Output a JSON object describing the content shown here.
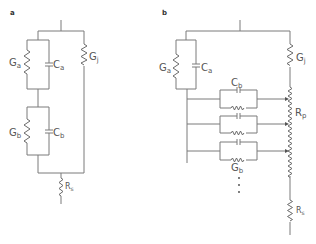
{
  "panels": [
    {
      "id": "a",
      "label": "a",
      "components": {
        "Ga": {
          "symbol": "G",
          "sub": "a",
          "type": "resistor"
        },
        "Ca": {
          "symbol": "C",
          "sub": "a",
          "type": "capacitor"
        },
        "Gb": {
          "symbol": "G",
          "sub": "b",
          "type": "resistor"
        },
        "Cb": {
          "symbol": "C",
          "sub": "b",
          "type": "capacitor"
        },
        "Gj": {
          "symbol": "G",
          "sub": "j",
          "type": "resistor"
        },
        "Rs": {
          "symbol": "R",
          "sub": "s",
          "type": "resistor"
        }
      }
    },
    {
      "id": "b",
      "label": "b",
      "components": {
        "Ga": {
          "symbol": "G",
          "sub": "a",
          "type": "resistor"
        },
        "Ca": {
          "symbol": "C",
          "sub": "a",
          "type": "capacitor"
        },
        "Cb": {
          "symbol": "C",
          "sub": "b",
          "type": "capacitor"
        },
        "Gb": {
          "symbol": "G",
          "sub": "b",
          "type": "resistor"
        },
        "Gj": {
          "symbol": "G",
          "sub": "j",
          "type": "resistor"
        },
        "Rp": {
          "symbol": "R",
          "sub": "p",
          "type": "distributed-resistor"
        },
        "Rs": {
          "symbol": "R",
          "sub": "s",
          "type": "resistor"
        }
      },
      "ellipsis": "..."
    }
  ],
  "colors": {
    "line": "#7a7a7a",
    "text": "#555555"
  }
}
